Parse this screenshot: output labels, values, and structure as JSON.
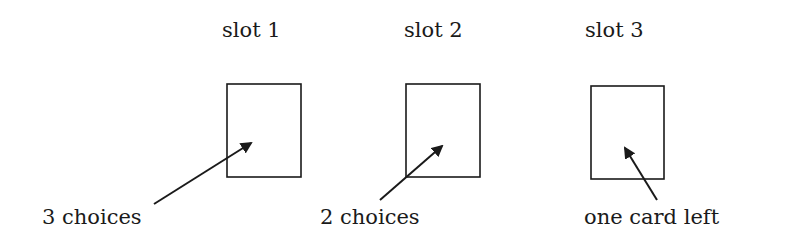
{
  "diagram": {
    "slots": [
      {
        "title": "slot 1",
        "title_pos": {
          "x": 222,
          "y": 20
        },
        "box": {
          "x": 227,
          "y": 84,
          "w": 74,
          "h": 93
        },
        "note": "3 choices",
        "note_pos": {
          "x": 42,
          "y": 207
        },
        "arrow": {
          "x1": 154,
          "y1": 204,
          "x2": 251,
          "y2": 143
        }
      },
      {
        "title": "slot 2",
        "title_pos": {
          "x": 404,
          "y": 20
        },
        "box": {
          "x": 406,
          "y": 84,
          "w": 74,
          "h": 93
        },
        "note": "2 choices",
        "note_pos": {
          "x": 320,
          "y": 207
        },
        "arrow": {
          "x1": 380,
          "y1": 200,
          "x2": 442,
          "y2": 146
        }
      },
      {
        "title": "slot 3",
        "title_pos": {
          "x": 585,
          "y": 20
        },
        "box": {
          "x": 591,
          "y": 86,
          "w": 73,
          "h": 93
        },
        "note": "one card left",
        "note_pos": {
          "x": 584,
          "y": 207
        },
        "arrow": {
          "x1": 657,
          "y1": 200,
          "x2": 625,
          "y2": 148
        }
      }
    ],
    "colors": {
      "stroke": "#1a1a1a",
      "background": "#ffffff"
    }
  }
}
